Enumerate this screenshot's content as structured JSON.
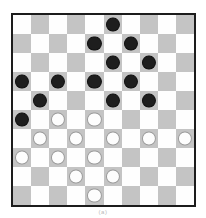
{
  "figure": {
    "caption": "(a)"
  },
  "board": {
    "name": "draughts-board",
    "rows": 10,
    "columns": 10,
    "light_square_color": "#fefefe",
    "dark_square_color": "#c4c4c4",
    "border_color": "#1c1c1c",
    "black_piece_color": "#1e1e1e",
    "white_piece_color": "#fdfdfd",
    "white_piece_outline_color": "#9a9a9a",
    "light_first": true,
    "black_piece_count": 15,
    "white_piece_count": 16,
    "cells": [
      [
        "",
        "",
        "",
        "",
        "",
        "black",
        "",
        "",
        "",
        ""
      ],
      [
        "",
        "",
        "",
        "",
        "black",
        "",
        "black",
        "",
        "",
        ""
      ],
      [
        "",
        "",
        "",
        "",
        "",
        "black",
        "",
        "black",
        "",
        ""
      ],
      [
        "black",
        "",
        "black",
        "",
        "black",
        "",
        "black",
        "",
        "",
        ""
      ],
      [
        "",
        "black",
        "",
        "",
        "",
        "black",
        "",
        "black",
        "",
        ""
      ],
      [
        "black",
        "",
        "white",
        "",
        "white",
        "",
        "",
        "",
        "",
        ""
      ],
      [
        "",
        "white",
        "",
        "white",
        "",
        "white",
        "",
        "white",
        "",
        "white"
      ],
      [
        "white",
        "",
        "white",
        "",
        "white",
        "",
        "",
        "",
        "",
        ""
      ],
      [
        "",
        "",
        "",
        "white",
        "",
        "white",
        "",
        "",
        "",
        ""
      ],
      [
        "",
        "",
        "",
        "",
        "white",
        "",
        "",
        "",
        "",
        ""
      ]
    ]
  }
}
